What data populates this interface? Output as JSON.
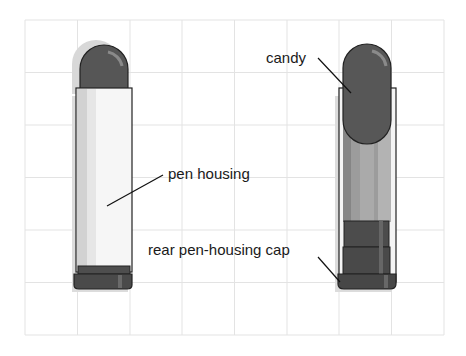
{
  "diagram": {
    "grid": {
      "x0": 25,
      "y0": 20,
      "cols": 8,
      "rows": 6,
      "cell": 52.4,
      "color": "#e2e2e2"
    },
    "colors": {
      "candy": "#555555",
      "candy_highlight": "#7a7a7a",
      "housing_fill": "#f4f4f4",
      "housing_shade": "#d4d4d4",
      "outline": "#222222",
      "cap": "#4a4a4a",
      "inner_tube": "#9a9a9a",
      "shadow": "#cfcfcf"
    },
    "labels": [
      {
        "id": "candy",
        "text": "candy"
      },
      {
        "id": "pen-housing",
        "text": "pen housing"
      },
      {
        "id": "rear-cap",
        "text": "rear pen-housing cap"
      }
    ],
    "figures": [
      {
        "id": "assembled-pen",
        "description": "Assembled pen with housing covering candy"
      },
      {
        "id": "cutaway-pen",
        "description": "Cutaway view showing candy inside housing"
      }
    ]
  }
}
